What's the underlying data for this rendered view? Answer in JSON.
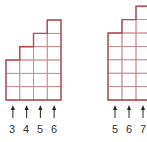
{
  "colors": {
    "outline": "#b5474f",
    "grid": "#c98a8f",
    "arrow": "#222222",
    "label": "#333333"
  },
  "figures": [
    {
      "name": "staircase-left",
      "origin_x": 6,
      "bottom_y": 100,
      "cell_w": 13.75,
      "cell_h": 13.33,
      "column_heights": [
        3,
        4,
        5,
        6
      ],
      "labels": [
        "3",
        "4",
        "5",
        "6"
      ]
    },
    {
      "name": "staircase-right",
      "origin_x": 108,
      "bottom_y": 100,
      "cell_w": 14,
      "cell_h": 13.4,
      "column_heights": [
        5,
        6,
        7,
        8
      ],
      "labels": [
        "5",
        "6",
        "7"
      ]
    }
  ],
  "labels": {
    "left": [
      "3",
      "4",
      "5",
      "6"
    ],
    "right": [
      "5",
      "6",
      "7"
    ]
  }
}
